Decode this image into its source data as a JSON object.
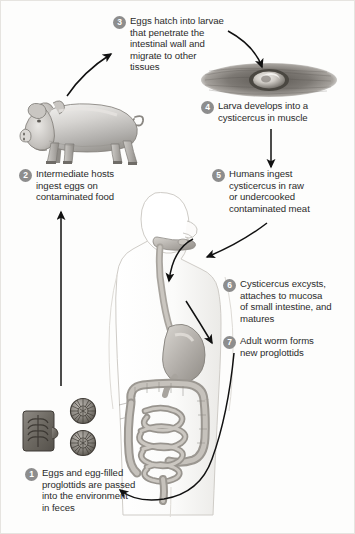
{
  "figure": {
    "background_color": "#fdfdfc",
    "badge_color": "#8d8d8d",
    "badge_text_color": "#ffffff",
    "text_color": "#2b2b2b",
    "arrow_color": "#111111"
  },
  "steps": [
    {
      "number": "1",
      "text": "Eggs and egg-filled\nproglottids are passed\ninto the environment\nin feces"
    },
    {
      "number": "2",
      "text": "Intermediate hosts\ningest eggs on\ncontaminated food"
    },
    {
      "number": "3",
      "text": "Eggs hatch into larvae\nthat penetrate the\nintestinal wall and\nmigrate to other\ntissues"
    },
    {
      "number": "4",
      "text": "Larva develops into a\ncysticercus in muscle"
    },
    {
      "number": "5",
      "text": "Humans ingest\ncysticercus in raw\nor undercooked\ncontaminated meat"
    },
    {
      "number": "6",
      "text": "Cysticercus excysts,\nattaches to mucosa\nof small intestine, and\nmatures"
    },
    {
      "number": "7",
      "text": "Adult worm forms\nnew proglottids"
    }
  ],
  "illustrations": {
    "pig": "pig-illustration",
    "muscle": "muscle-with-cysticercus-illustration",
    "human": "human-digestive-tract-illustration",
    "eggs": "eggs-and-proglottid-illustration"
  },
  "arrows": [
    {
      "name": "pig-to-step3",
      "from": "pig",
      "to": "step-3"
    },
    {
      "name": "step3-to-muscle",
      "from": "step-3",
      "to": "muscle"
    },
    {
      "name": "muscle-to-step5",
      "from": "step-4",
      "to": "step-5"
    },
    {
      "name": "step5-to-mouth",
      "from": "step-5",
      "to": "human-mouth"
    },
    {
      "name": "mouth-to-esophagus",
      "from": "human-mouth",
      "to": "esophagus"
    },
    {
      "name": "esophagus-to-stomach",
      "from": "esophagus",
      "to": "stomach"
    },
    {
      "name": "intestine-to-feces",
      "from": "intestine",
      "to": "step-1"
    },
    {
      "name": "feces-to-pig",
      "from": "step-1",
      "to": "step-2"
    }
  ]
}
